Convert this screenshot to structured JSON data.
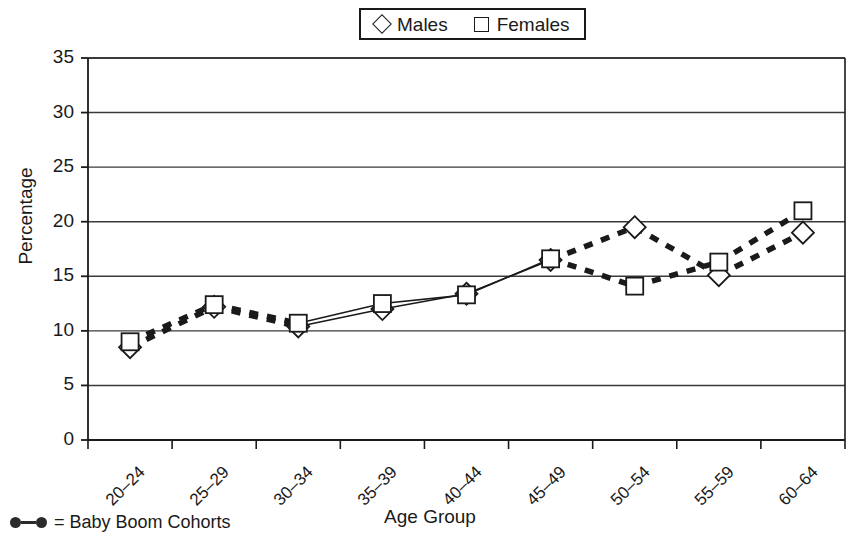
{
  "legend": {
    "entries": [
      {
        "marker": "diamond-marker-icon",
        "label": "Males"
      },
      {
        "marker": "square-marker-icon",
        "label": "Females"
      }
    ]
  },
  "footnote": {
    "marker": "baby-boom-line-icon",
    "text": "= Baby Boom Cohorts"
  },
  "chart_data": {
    "type": "line",
    "title": "",
    "xlabel": "Age Group",
    "ylabel": "Percentage",
    "categories": [
      "20–24",
      "25–29",
      "30–34",
      "35–39",
      "40–44",
      "45–49",
      "50–54",
      "55–59",
      "60–64"
    ],
    "ylim": [
      0,
      35
    ],
    "yticks": [
      0,
      5,
      10,
      15,
      20,
      25,
      30,
      35
    ],
    "ytick_labels": [
      "0",
      "5",
      "10",
      "15",
      "20",
      "25",
      "30",
      "35"
    ],
    "grid": "horizontal",
    "legend_position": "top-center",
    "series": [
      {
        "name": "Males",
        "marker": "diamond",
        "values": [
          8.5,
          12.2,
          10.4,
          12.0,
          13.4,
          16.5,
          19.5,
          15.1,
          19.0
        ]
      },
      {
        "name": "Females",
        "marker": "square",
        "values": [
          9.0,
          12.4,
          10.7,
          12.5,
          13.3,
          16.6,
          14.1,
          16.3,
          21.0
        ]
      }
    ],
    "baby_boom_segments": {
      "note": "Thick dashed line style marks Baby Boom cohort ranges",
      "Males": [
        [
          0,
          1
        ],
        [
          1,
          2
        ],
        [
          5,
          6
        ],
        [
          6,
          7
        ],
        [
          7,
          8
        ]
      ],
      "Females": [
        [
          0,
          1
        ],
        [
          1,
          2
        ],
        [
          5,
          6
        ],
        [
          6,
          7
        ],
        [
          7,
          8
        ]
      ]
    },
    "solid_segments": {
      "Males": [
        [
          2,
          3
        ],
        [
          3,
          4
        ],
        [
          4,
          5
        ]
      ],
      "Females": [
        [
          2,
          3
        ],
        [
          3,
          4
        ],
        [
          4,
          5
        ]
      ]
    }
  },
  "colors": {
    "line": "#1a1a1a",
    "grid": "#3a3a3a",
    "background": "#ffffff"
  }
}
